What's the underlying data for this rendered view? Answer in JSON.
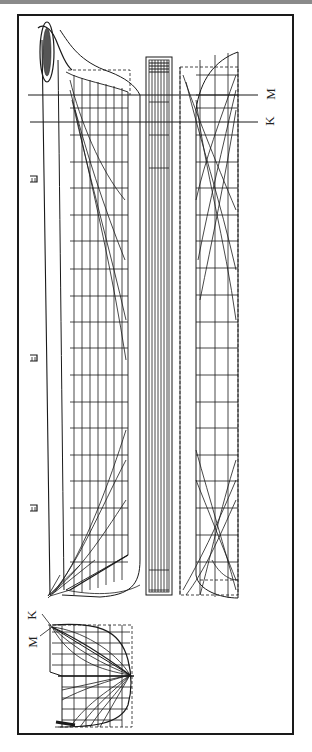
{
  "drawing": {
    "type": "ship lines plan",
    "orientation": "rotated 90 degrees",
    "views": [
      "profile",
      "half-breadth plan",
      "waterlines plan",
      "body plan"
    ],
    "section_labels": {
      "m": "M",
      "k": "K"
    },
    "body_plan_labels": {
      "m": "M",
      "k": "K"
    },
    "station_numbers": [
      "1",
      "2",
      "3",
      "4",
      "5",
      "6",
      "7",
      "8",
      "9",
      "10",
      "11",
      "12",
      "13"
    ],
    "masts": 3,
    "colors": {
      "ink": "#1a1a1a",
      "paper": "#ffffff",
      "topbar": "#8a8a8a"
    }
  }
}
